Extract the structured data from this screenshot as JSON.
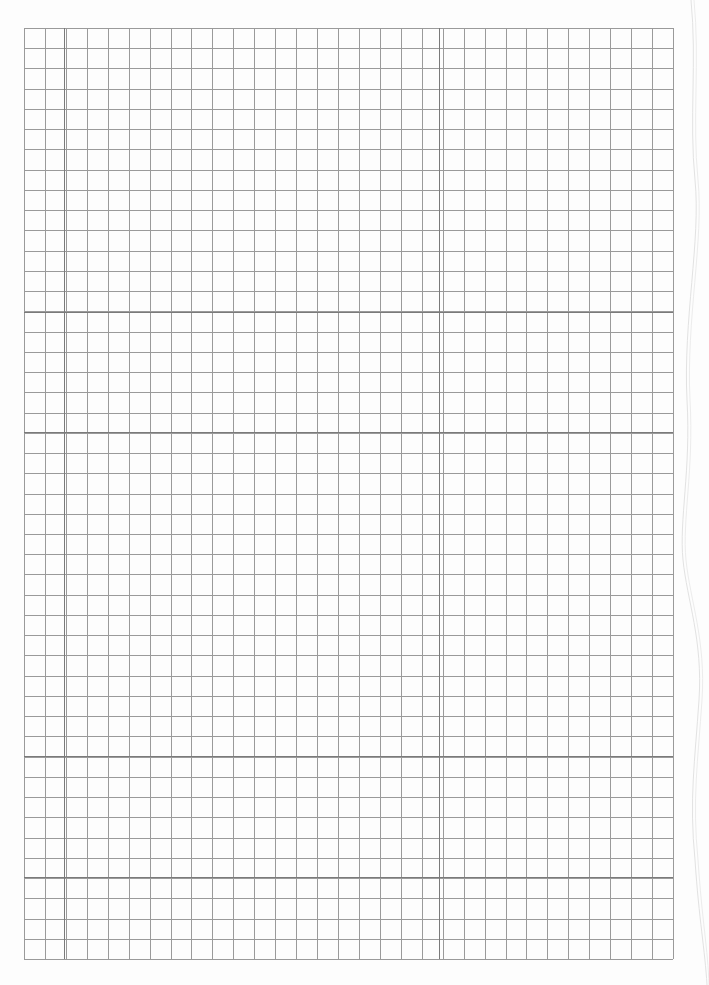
{
  "page": {
    "type": "graph-paper",
    "background": "#fdfdfd",
    "text": []
  },
  "grid": {
    "left": 24,
    "top": 28,
    "right": 673,
    "bottom": 959,
    "columns": 31,
    "rows": 46,
    "minor_line_color": "#9a9a9a",
    "major_line_color": "#7a7a7a",
    "major_vertical_x": [
      64,
      439
    ],
    "major_horizontal_y": [
      312,
      432,
      756,
      877
    ]
  }
}
